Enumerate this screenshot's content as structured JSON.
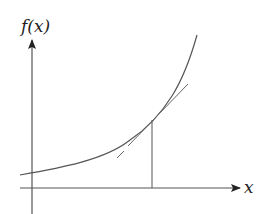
{
  "diagram": {
    "type": "tangent-line-illustration",
    "labels": {
      "y_axis": "f(x)",
      "x_axis": "x"
    },
    "colors": {
      "axis": "#555555",
      "curve": "#555555",
      "tangent": "#666666",
      "label": "#222222",
      "background": "#ffffff"
    },
    "elements": [
      {
        "name": "y-axis",
        "description": "vertical axis with arrowhead pointing up"
      },
      {
        "name": "x-axis",
        "description": "horizontal axis with arrowhead pointing right"
      },
      {
        "name": "curve",
        "description": "increasing convex (exponential-like) function"
      },
      {
        "name": "tangent-line",
        "description": "straight line touching the curve at one point"
      },
      {
        "name": "drop-line",
        "description": "vertical line from tangent point down to x-axis"
      }
    ]
  }
}
